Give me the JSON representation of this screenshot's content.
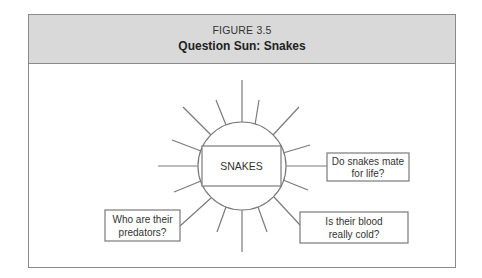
{
  "figure": {
    "label": "FIGURE 3.5",
    "title": "Question Sun: Snakes"
  },
  "diagram": {
    "center_label": "SNAKES",
    "questions": [
      {
        "line1": "Do snakes mate",
        "line2": "for life?"
      },
      {
        "line1": "Is their blood",
        "line2": "really cold?"
      },
      {
        "line1": "Who are their",
        "line2": "predators?"
      }
    ]
  },
  "colors": {
    "header_bg": "#d9d9d9",
    "stroke": "#7a7a7a",
    "text": "#333333"
  }
}
